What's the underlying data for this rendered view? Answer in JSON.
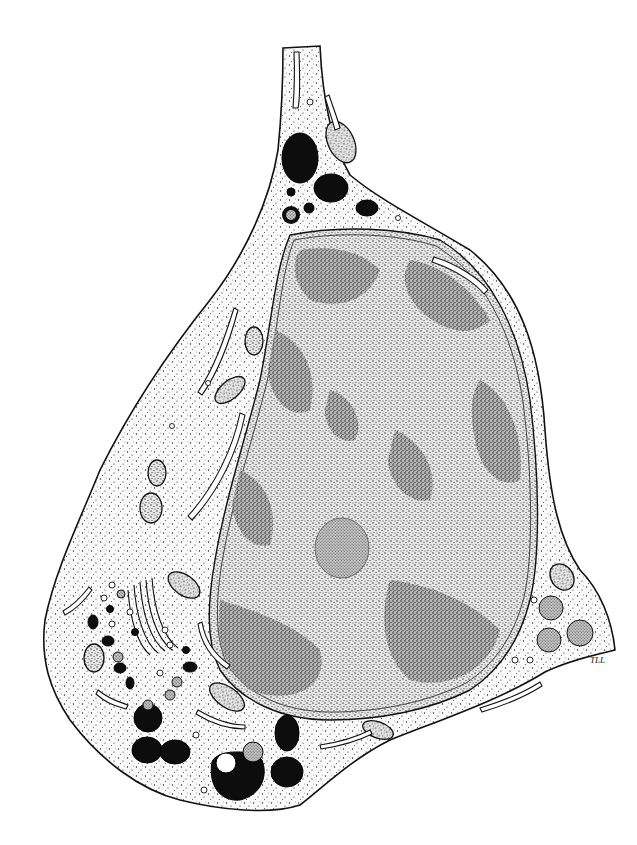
{
  "figure": {
    "style": "stippled pen-and-ink drawing",
    "colors": {
      "background": "#ffffff",
      "ink": "#111111",
      "cytoplasm": "#f7f7f7",
      "nucleus": "#d8d8d8",
      "heterochromatin": "#b5b5b5",
      "dense_granule": "#0d0d0d"
    },
    "signature": "TLL"
  }
}
